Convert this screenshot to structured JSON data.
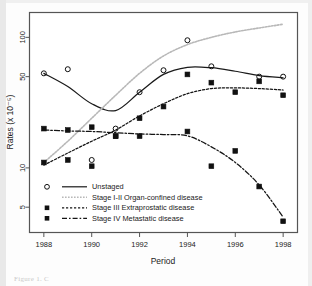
{
  "figure": {
    "caption_fragment": "Figure 1. C"
  },
  "chart_data": {
    "type": "scatter",
    "title": "",
    "xlabel": "Period",
    "ylabel": "Rates (x 10⁻⁵)",
    "x": [
      1988,
      1989,
      1990,
      1991,
      1992,
      1993,
      1994,
      1995,
      1996,
      1997,
      1998
    ],
    "xlim": [
      1987.4,
      1998.6
    ],
    "ylim": [
      3.2,
      155
    ],
    "yscale": "log",
    "xticks": [
      1988,
      1990,
      1992,
      1994,
      1996,
      1998
    ],
    "xticklabels": [
      "1988",
      "1990",
      "1992",
      "1994",
      "1996",
      "1998"
    ],
    "yticks": [
      5,
      10,
      50,
      100
    ],
    "yticklabels": [
      "5",
      "10",
      "50",
      "100"
    ],
    "grid": false,
    "legend_position": "lower left",
    "series": [
      {
        "name": "Unstaged",
        "label": "Unstaged",
        "marker": "open-circle",
        "linestyle": "solid",
        "color": "#1a1a1a",
        "points": [
          53.0,
          57.0,
          11.5,
          20.0,
          38.0,
          56.0,
          95.0,
          60.0,
          null,
          50.0,
          50.0
        ],
        "fit": [
          53.0,
          42.0,
          31.0,
          27.5,
          38.0,
          52.0,
          59.0,
          58.5,
          55.0,
          51.0,
          49.0
        ]
      },
      {
        "name": "Stage I-II Organ-confined disease",
        "label": "Stage I-II Organ-confined disease",
        "marker": "none",
        "linestyle": "dotted",
        "color": "#b8b8b8",
        "points": [
          null,
          null,
          null,
          null,
          null,
          95.0,
          null,
          null,
          null,
          null,
          null
        ],
        "fit": [
          11.0,
          16.0,
          24.0,
          36.0,
          53.0,
          72.0,
          88.0,
          100.0,
          110.0,
          118.0,
          126.0
        ]
      },
      {
        "name": "Stage III Extraprostatic disease",
        "label": "Stage III Extraprostatic disease",
        "marker": "filled-square",
        "linestyle": "dashed-fine",
        "color": "#141414",
        "points": [
          11.0,
          11.5,
          10.3,
          17.5,
          24.0,
          29.5,
          52.0,
          45.0,
          38.0,
          46.0,
          36.0
        ],
        "fit": [
          10.5,
          13.0,
          16.0,
          19.5,
          25.0,
          31.0,
          37.0,
          40.5,
          41.0,
          40.5,
          39.5
        ]
      },
      {
        "name": "Stage IV Metastatic disease",
        "label": "Stage IV Metastatic disease",
        "marker": "filled-square",
        "linestyle": "dash-dot",
        "color": "#141414",
        "points": [
          20.0,
          19.5,
          20.5,
          17.5,
          17.5,
          null,
          19.0,
          10.3,
          13.5,
          7.2,
          3.9
        ],
        "fit": [
          19.5,
          19.2,
          19.0,
          18.6,
          18.2,
          18.0,
          17.6,
          14.5,
          11.0,
          7.4,
          4.2
        ]
      }
    ]
  }
}
